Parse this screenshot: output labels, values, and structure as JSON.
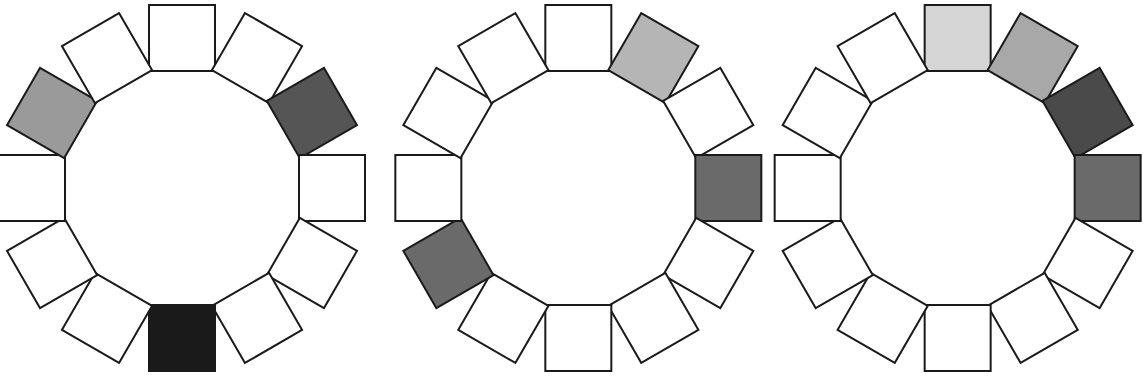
{
  "figure": {
    "width": 1145,
    "height": 381,
    "background_color": "#ffffff",
    "panel_count": 3,
    "squares_per_ring": 12,
    "angular_step_degrees": 30,
    "square_size_px": 66,
    "ring_radius_px": 150,
    "outline_color": "#1a1a1a",
    "outline_width_px": 2,
    "default_fill": "#ffffff",
    "rotation_rule": "each square is rotated by its angular position around the ring so its edges stay tangent to the circle"
  },
  "palette": {
    "white": "#ffffff",
    "very_light_gray": "#d5d5d5",
    "light_gray": "#b5b5b5",
    "medium_light_gray": "#a8a8a8",
    "medium_gray": "#9a9a9a",
    "medium_dark_gray": "#6a6a6a",
    "dark_gray": "#555555",
    "darker_gray": "#4a4a4a",
    "near_black": "#1a1a1a"
  },
  "rings": [
    {
      "id": "ring-1",
      "label": "Ring 1",
      "center_x": 182,
      "center_y": 188,
      "colored_count": 3,
      "squares": [
        {
          "index": 0,
          "angle": 0,
          "fill": "#ffffff",
          "state": "empty"
        },
        {
          "index": 1,
          "angle": 30,
          "fill": "#ffffff",
          "state": "empty"
        },
        {
          "index": 2,
          "angle": 60,
          "fill": "#555555",
          "state": "filled"
        },
        {
          "index": 3,
          "angle": 90,
          "fill": "#ffffff",
          "state": "empty"
        },
        {
          "index": 4,
          "angle": 120,
          "fill": "#ffffff",
          "state": "empty"
        },
        {
          "index": 5,
          "angle": 150,
          "fill": "#ffffff",
          "state": "empty"
        },
        {
          "index": 6,
          "angle": 180,
          "fill": "#1a1a1a",
          "state": "filled"
        },
        {
          "index": 7,
          "angle": 210,
          "fill": "#ffffff",
          "state": "empty"
        },
        {
          "index": 8,
          "angle": 240,
          "fill": "#ffffff",
          "state": "empty"
        },
        {
          "index": 9,
          "angle": 270,
          "fill": "#ffffff",
          "state": "empty"
        },
        {
          "index": 10,
          "angle": 300,
          "fill": "#9a9a9a",
          "state": "filled"
        },
        {
          "index": 11,
          "angle": 330,
          "fill": "#ffffff",
          "state": "empty"
        }
      ]
    },
    {
      "id": "ring-2",
      "label": "Ring 2",
      "center_x": 578,
      "center_y": 188,
      "colored_count": 3,
      "squares": [
        {
          "index": 0,
          "angle": 0,
          "fill": "#ffffff",
          "state": "empty"
        },
        {
          "index": 1,
          "angle": 30,
          "fill": "#b5b5b5",
          "state": "filled"
        },
        {
          "index": 2,
          "angle": 60,
          "fill": "#ffffff",
          "state": "empty"
        },
        {
          "index": 3,
          "angle": 90,
          "fill": "#6a6a6a",
          "state": "filled"
        },
        {
          "index": 4,
          "angle": 120,
          "fill": "#ffffff",
          "state": "empty"
        },
        {
          "index": 5,
          "angle": 150,
          "fill": "#ffffff",
          "state": "empty"
        },
        {
          "index": 6,
          "angle": 180,
          "fill": "#ffffff",
          "state": "empty"
        },
        {
          "index": 7,
          "angle": 210,
          "fill": "#ffffff",
          "state": "empty"
        },
        {
          "index": 8,
          "angle": 240,
          "fill": "#6a6a6a",
          "state": "filled"
        },
        {
          "index": 9,
          "angle": 270,
          "fill": "#ffffff",
          "state": "empty"
        },
        {
          "index": 10,
          "angle": 300,
          "fill": "#ffffff",
          "state": "empty"
        },
        {
          "index": 11,
          "angle": 330,
          "fill": "#ffffff",
          "state": "empty"
        }
      ]
    },
    {
      "id": "ring-3",
      "label": "Ring 3",
      "center_x": 958,
      "center_y": 188,
      "colored_count": 4,
      "squares": [
        {
          "index": 0,
          "angle": 0,
          "fill": "#d5d5d5",
          "state": "filled"
        },
        {
          "index": 1,
          "angle": 30,
          "fill": "#a8a8a8",
          "state": "filled"
        },
        {
          "index": 2,
          "angle": 60,
          "fill": "#4a4a4a",
          "state": "filled"
        },
        {
          "index": 3,
          "angle": 90,
          "fill": "#6a6a6a",
          "state": "filled"
        },
        {
          "index": 4,
          "angle": 120,
          "fill": "#ffffff",
          "state": "empty"
        },
        {
          "index": 5,
          "angle": 150,
          "fill": "#ffffff",
          "state": "empty"
        },
        {
          "index": 6,
          "angle": 180,
          "fill": "#ffffff",
          "state": "empty"
        },
        {
          "index": 7,
          "angle": 210,
          "fill": "#ffffff",
          "state": "empty"
        },
        {
          "index": 8,
          "angle": 240,
          "fill": "#ffffff",
          "state": "empty"
        },
        {
          "index": 9,
          "angle": 270,
          "fill": "#ffffff",
          "state": "empty"
        },
        {
          "index": 10,
          "angle": 300,
          "fill": "#ffffff",
          "state": "empty"
        },
        {
          "index": 11,
          "angle": 330,
          "fill": "#ffffff",
          "state": "empty"
        }
      ]
    }
  ]
}
